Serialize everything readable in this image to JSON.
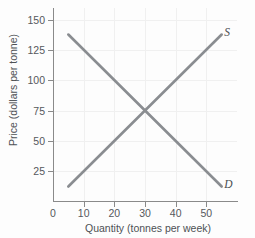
{
  "figure": {
    "crop_artifact_text": "",
    "background_color": "#fdfdfd"
  },
  "chart_data": {
    "type": "line",
    "title": "",
    "xlabel": "Quantity (tonnes per week)",
    "ylabel": "Price (dollars per tonne)",
    "xlim": [
      0,
      60
    ],
    "ylim": [
      0,
      160
    ],
    "xticks": [
      0,
      10,
      20,
      30,
      40,
      50
    ],
    "xtick_labels": [
      "0",
      "10",
      "20",
      "30",
      "40",
      "50"
    ],
    "yticks": [
      25,
      50,
      75,
      100,
      125,
      150
    ],
    "ytick_labels": [
      "25",
      "50",
      "75",
      "100",
      "125",
      "150"
    ],
    "grid": true,
    "legend_position": "curve-end-labels",
    "curve_color": "#8a8d91",
    "series": [
      {
        "name": "D",
        "label": "D",
        "description": "Demand curve, downward sloping",
        "x": [
          5,
          55
        ],
        "values": [
          138,
          12
        ],
        "label_position": {
          "x": 56.5,
          "y": 14
        }
      },
      {
        "name": "S",
        "label": "S",
        "description": "Supply curve, upward sloping",
        "x": [
          5,
          55
        ],
        "values": [
          12,
          138
        ],
        "label_position": {
          "x": 56.5,
          "y": 140
        }
      }
    ],
    "annotations": [
      {
        "name": "equilibrium",
        "x": 30,
        "y": 75,
        "label": ""
      }
    ]
  }
}
